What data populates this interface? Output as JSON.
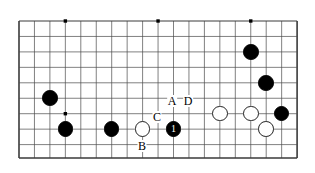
{
  "diagram": {
    "type": "go-board-diagram",
    "board": {
      "columns": 19,
      "rows": 10,
      "origin_x": 19,
      "origin_y": 21,
      "cell_size": 15.45,
      "line_color": "#4a4a4a",
      "border_color": "#3a3a3a",
      "background_color": "#ffffff",
      "border_left_x": 19,
      "border_right_x": 297,
      "border_bottom_y": 158,
      "top_line_y": 21
    },
    "star_points": [
      {
        "col": 3,
        "row": 0
      },
      {
        "col": 9,
        "row": 0
      },
      {
        "col": 15,
        "row": 0
      },
      {
        "col": 3,
        "row": 6
      }
    ],
    "stones": [
      {
        "id": "b-left-upper",
        "color": "black",
        "col": 2,
        "row": 5,
        "label": ""
      },
      {
        "id": "b-left-lower",
        "color": "black",
        "col": 3,
        "row": 7,
        "label": ""
      },
      {
        "id": "b-bottom-mid",
        "color": "black",
        "col": 6,
        "row": 7,
        "label": ""
      },
      {
        "id": "w-bottom-mid",
        "color": "white",
        "col": 8,
        "row": 7,
        "label": ""
      },
      {
        "id": "b-move-1",
        "color": "black",
        "col": 10,
        "row": 7,
        "label": "1"
      },
      {
        "id": "w-right-a",
        "color": "white",
        "col": 13,
        "row": 6,
        "label": ""
      },
      {
        "id": "w-right-b",
        "color": "white",
        "col": 15,
        "row": 6,
        "label": ""
      },
      {
        "id": "w-right-c",
        "color": "white",
        "col": 16,
        "row": 7,
        "label": ""
      },
      {
        "id": "b-right-edge",
        "color": "black",
        "col": 17,
        "row": 6,
        "label": ""
      },
      {
        "id": "b-upper-right-1",
        "color": "black",
        "col": 15,
        "row": 2,
        "label": ""
      },
      {
        "id": "b-upper-right-2",
        "color": "black",
        "col": 16,
        "row": 4,
        "label": ""
      }
    ],
    "point_labels": [
      {
        "id": "label-a",
        "text": "A",
        "x": 172,
        "y": 101
      },
      {
        "id": "label-d",
        "text": "D",
        "x": 188,
        "y": 101
      },
      {
        "id": "label-c",
        "text": "C",
        "x": 157,
        "y": 117
      },
      {
        "id": "label-b",
        "text": "B",
        "x": 142,
        "y": 146
      }
    ],
    "colors": {
      "black_stone": "#000000",
      "white_stone": "#ffffff",
      "stone_outline": "#222222",
      "grid_line": "#4a4a4a",
      "board_border": "#3a3a3a",
      "label_text": "#000000",
      "move_number_text": "#ffffff"
    }
  }
}
